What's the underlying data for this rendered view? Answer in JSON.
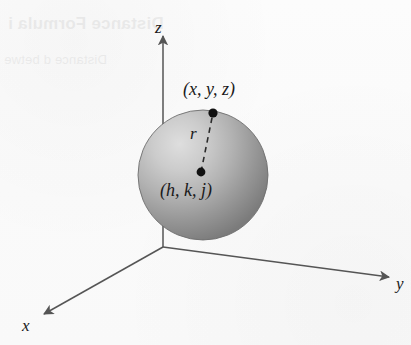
{
  "figure": {
    "kind": "3d-sphere-coordinate-diagram",
    "background_color": "#fbfbfb",
    "ink_color": "#555555",
    "label_color": "#1a1a1a"
  },
  "axes": {
    "z": {
      "label": "z",
      "direction": "up"
    },
    "y": {
      "label": "y",
      "direction": "right-down"
    },
    "x": {
      "label": "x",
      "direction": "left-down"
    },
    "origin": {
      "x": 163,
      "y": 247
    }
  },
  "sphere": {
    "center": {
      "x": 203,
      "y": 175
    },
    "radius": 65,
    "fill_light": "#d8d8d8",
    "fill_mid": "#a9a9a9",
    "fill_dark": "#777777",
    "edge_color": "#6e6e6e"
  },
  "points": [
    {
      "name": "surface-point",
      "label": "(x, y, z)",
      "x": 213,
      "y": 113
    },
    {
      "name": "center-point",
      "label": "(h, k, j)",
      "x": 201,
      "y": 172
    }
  ],
  "radius_segment": {
    "label": "r",
    "style": "dashed",
    "from": {
      "x": 201,
      "y": 172
    },
    "to": {
      "x": 213,
      "y": 113
    }
  },
  "bleed_through": {
    "title": "Distance Formula i",
    "subtitle": "Distance d betwe"
  }
}
